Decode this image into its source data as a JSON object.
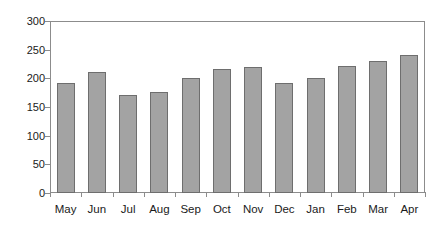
{
  "chart_data": {
    "type": "bar",
    "title": "",
    "subtitle": "",
    "xlabel": "",
    "ylabel": "",
    "categories": [
      "May",
      "Jun",
      "Jul",
      "Aug",
      "Sep",
      "Oct",
      "Nov",
      "Dec",
      "Jan",
      "Feb",
      "Mar",
      "Apr"
    ],
    "values": [
      191,
      211,
      171,
      176,
      201,
      216,
      220,
      191,
      201,
      221,
      231,
      241
    ],
    "series": [
      {
        "name": "",
        "values": [
          191,
          211,
          171,
          176,
          201,
          216,
          220,
          191,
          201,
          221,
          231,
          241
        ]
      }
    ],
    "ylim": [
      0,
      300
    ],
    "y_ticks": [
      0,
      50,
      100,
      150,
      200,
      250,
      300
    ],
    "y_tick_labels": [
      "0",
      "50",
      "100",
      "150",
      "200",
      "250",
      "300"
    ],
    "x_tick_labels": [
      "May",
      "Jun",
      "Jul",
      "Aug",
      "Sep",
      "Oct",
      "Nov",
      "Dec",
      "Jan",
      "Feb",
      "Mar",
      "Apr"
    ],
    "grid": false,
    "legend": null,
    "legend_position": "none",
    "annotations": [],
    "colors": {
      "bar_fill": "#a3a3a3",
      "bar_stroke": "#6e6e6e",
      "axis": "#8c8c8c",
      "text": "#1a1a1a",
      "background": "#ffffff"
    }
  }
}
